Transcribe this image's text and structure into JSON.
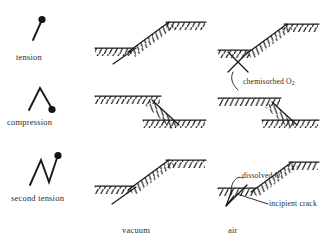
{
  "figure": {
    "type": "schematic-diagram",
    "background_color": "#ffffff",
    "ink_color": "#1a1a1a"
  },
  "rows": [
    {
      "id": "tension",
      "stage_label": "tension",
      "symbol": "load-tension-icon",
      "symbol_description": "short upward stroke with filled dot at upper end"
    },
    {
      "id": "compression",
      "stage_label": "compression",
      "symbol": "load-compression-icon",
      "symbol_description": "inverted-V stroke with filled dot at lower right end"
    },
    {
      "id": "second-tension",
      "stage_label": "second tension",
      "symbol": "load-second-tension-icon",
      "symbol_description": "zigzag stroke with filled dot at upper right end"
    }
  ],
  "columns": [
    {
      "id": "vacuum",
      "label": "vacuum"
    },
    {
      "id": "air",
      "label": "air"
    }
  ],
  "annotations": [
    {
      "id": "chemisorbed-oxygen",
      "text": "chemisorbed O",
      "subscript": "2",
      "column": "air",
      "row": "compression"
    },
    {
      "id": "dissolved-oxygen",
      "text": "dissolved O",
      "subscript": "",
      "column": "air",
      "row": "second-tension"
    },
    {
      "id": "incipient-crack",
      "text": "incipient crack",
      "subscript": "",
      "column": "air",
      "row": "second-tension"
    }
  ]
}
